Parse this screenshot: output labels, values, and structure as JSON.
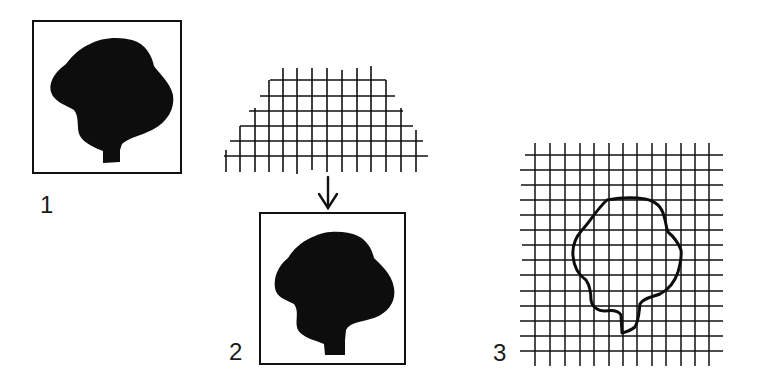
{
  "figure": {
    "ink_color": "#111111",
    "background": "#ffffff"
  },
  "panels": [
    {
      "id": "1",
      "label": "1",
      "content": "framed-solid-tree-silhouette",
      "frame": {
        "x": 33,
        "y": 21,
        "w": 148,
        "h": 152
      }
    },
    {
      "id": "2",
      "label": "2",
      "content": "distorted-grid-overlay-arrow-to-framed-silhouette",
      "grid_shape": "stepped-trapezoid",
      "arrow": "down-arrow",
      "frame": {
        "x": 259,
        "y": 213,
        "w": 146,
        "h": 151
      }
    },
    {
      "id": "3",
      "label": "3",
      "content": "square-grid-with-tree-outline",
      "grid": {
        "columns": 13,
        "rows": 15
      }
    }
  ]
}
